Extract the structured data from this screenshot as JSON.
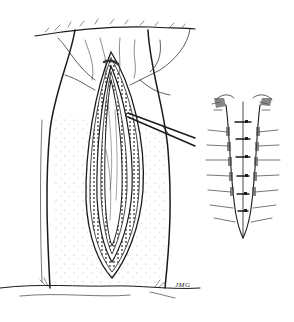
{
  "illustration": {
    "subject": "surgical incision illustration with forceps and sutured closure detail",
    "colors": {
      "ink": "#1a1a1a",
      "background": "#ffffff",
      "stipple": "#9a9a9a"
    },
    "main_figure": {
      "description": "elongated elliptical incision with retracted layered tissue edges and forceps inserted from right"
    },
    "inset_figure": {
      "description": "closed wound with interrupted sutures along midline",
      "suture_count": 6
    },
    "signature": "JMG"
  }
}
